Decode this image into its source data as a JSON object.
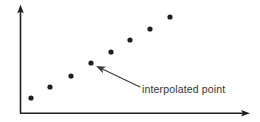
{
  "figure": {
    "title": "",
    "background_color": "#ffffff",
    "width": 260,
    "height": 122
  },
  "axes": {
    "line_color": "#231f20",
    "origin": {
      "x": 20,
      "y": 113
    },
    "y_axis": {
      "label": "",
      "from": {
        "x": 20,
        "y": 113
      },
      "to": {
        "x": 20,
        "y": 6
      },
      "arrow": "up-arrow"
    },
    "x_axis": {
      "label": "",
      "from": {
        "x": 20,
        "y": 113
      },
      "to": {
        "x": 250,
        "y": 113
      },
      "arrow": "right-arrow"
    }
  },
  "annotation": {
    "text": "interpolated point",
    "text_color": "#333335",
    "text_x": 142,
    "text_y": 93,
    "leader_color": "#3a3a3c",
    "leader_tail": {
      "x": 140,
      "y": 87
    },
    "leader_tip": {
      "x": 96,
      "y": 66
    },
    "points_to_index": 3
  },
  "chart_data": {
    "type": "scatter",
    "title": "",
    "xlabel": "",
    "ylabel": "",
    "xlim": [
      0,
      260
    ],
    "ylim": [
      0,
      122
    ],
    "grid": false,
    "legend": null,
    "axis_style": "arrow-axes-no-ticks",
    "tick_labels": {
      "x": [],
      "y": []
    },
    "point_color": "#231f20",
    "point_radius": 2.6,
    "series": [
      {
        "name": "data points",
        "points": [
          {
            "index": 0,
            "x": 31,
            "y": 98,
            "label": ""
          },
          {
            "index": 1,
            "x": 50,
            "y": 87,
            "label": ""
          },
          {
            "index": 2,
            "x": 71,
            "y": 76,
            "label": ""
          },
          {
            "index": 3,
            "x": 91,
            "y": 63,
            "label": "interpolated point"
          },
          {
            "index": 4,
            "x": 111,
            "y": 52,
            "label": ""
          },
          {
            "index": 5,
            "x": 130,
            "y": 40,
            "label": ""
          },
          {
            "index": 6,
            "x": 150,
            "y": 29,
            "label": ""
          },
          {
            "index": 7,
            "x": 170,
            "y": 17,
            "label": ""
          }
        ]
      }
    ],
    "annotations": [
      {
        "text": "interpolated point",
        "target": {
          "x": 91,
          "y": 63
        },
        "anchor": {
          "x": 142,
          "y": 90
        },
        "arrow": true
      }
    ]
  }
}
